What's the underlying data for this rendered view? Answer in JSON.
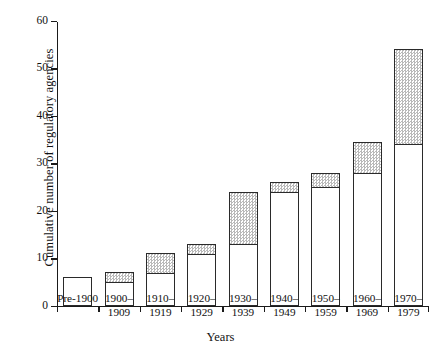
{
  "chart_data": {
    "type": "bar",
    "title": "",
    "subtitle": "",
    "xlabel": "Years",
    "ylabel": "Cumulative number of regulatory agencies",
    "categories": [
      "Pre-1900",
      "1900–\n1909",
      "1910–\n1919",
      "1920–\n1929",
      "1930–\n1939",
      "1940–\n1949",
      "1950–\n1959",
      "1960–\n1969",
      "1970–\n1979"
    ],
    "stacked": true,
    "series": [
      {
        "name": "carried-over total",
        "style": "white-fill",
        "values": [
          6,
          5,
          7,
          11,
          13,
          24,
          25,
          28,
          34
        ]
      },
      {
        "name": "new in decade",
        "style": "hatched-fill",
        "values": [
          0,
          2,
          4,
          2,
          11,
          2,
          3,
          6.5,
          20
        ]
      }
    ],
    "totals": [
      6,
      7,
      11,
      13,
      24,
      26,
      28,
      34.5,
      54
    ],
    "ylim": [
      0,
      60
    ],
    "yticks": [
      0,
      10,
      20,
      30,
      40,
      50,
      60
    ],
    "ytick_labels": [
      "0",
      "10",
      "20",
      "30",
      "40",
      "50",
      "60"
    ],
    "grid": false,
    "legend": "none",
    "axis_color": "#1a1a1a",
    "bar_edge_color": "#2a2a2a",
    "bar_fill_color": "#ffffff",
    "hatch_color": "#b9b9b9"
  }
}
